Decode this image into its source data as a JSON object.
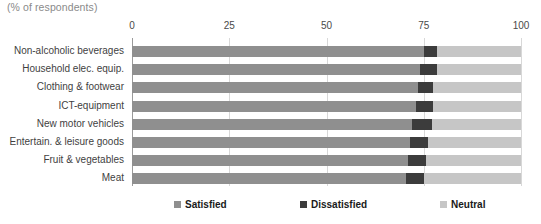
{
  "units_caption": "(% of respondents)",
  "axis": {
    "ticks": [
      {
        "label": "0",
        "value": 0
      },
      {
        "label": "25",
        "value": 25
      },
      {
        "label": "50",
        "value": 50
      },
      {
        "label": "75",
        "value": 75
      },
      {
        "label": "100",
        "value": 100
      }
    ],
    "min": 0,
    "max": 100
  },
  "legend": [
    {
      "label": "Satisfied",
      "color": "#8f8f8f",
      "key": "satisfied"
    },
    {
      "label": "Dissatisfied",
      "color": "#3c3c3c",
      "key": "dissatisfied"
    },
    {
      "label": "Neutral",
      "color": "#c6c6c6",
      "key": "neutral"
    }
  ],
  "chart_data": {
    "type": "bar",
    "orientation": "horizontal",
    "stacked": true,
    "title": "",
    "subtitle": "(% of respondents)",
    "xlabel": "",
    "ylabel": "",
    "xlim": [
      0,
      100
    ],
    "grid": true,
    "legend_position": "bottom",
    "xticks": [
      0,
      25,
      50,
      75,
      100
    ],
    "categories": [
      "Non-alcoholic beverages",
      "Household elec. equip.",
      "Clothing & footwear",
      "ICT-equipment",
      "New motor vehicles",
      "Entertain. & leisure goods",
      "Fruit & vegetables",
      "Meat"
    ],
    "series": [
      {
        "name": "Satisfied",
        "color": "#8f8f8f",
        "values": [
          75.0,
          74.0,
          73.5,
          73.0,
          72.0,
          71.5,
          71.0,
          70.5
        ]
      },
      {
        "name": "Dissatisfied",
        "color": "#3c3c3c",
        "values": [
          3.5,
          4.5,
          4.0,
          4.5,
          5.0,
          4.5,
          4.5,
          4.5
        ]
      },
      {
        "name": "Neutral",
        "color": "#c6c6c6",
        "values": [
          21.5,
          21.5,
          22.5,
          22.5,
          23.0,
          24.0,
          24.5,
          25.0
        ]
      }
    ]
  }
}
